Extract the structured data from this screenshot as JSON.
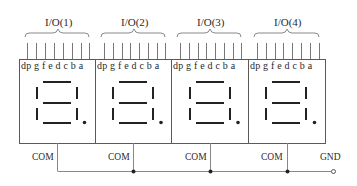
{
  "diagram": {
    "type": "4-digit 7-segment display common-cathode wiring",
    "modules": [
      {
        "io_label": "I/O(1)",
        "com_label": "COM"
      },
      {
        "io_label": "I/O(2)",
        "com_label": "COM"
      },
      {
        "io_label": "I/O(3)",
        "com_label": "COM"
      },
      {
        "io_label": "I/O(4)",
        "com_label": "COM"
      }
    ],
    "pin_labels": "dp g f e d c b a",
    "pins": [
      "dp",
      "g",
      "f",
      "e",
      "d",
      "c",
      "b",
      "a"
    ],
    "ground_label": "GND",
    "colors": {
      "line": "#555555",
      "segment": "#222222",
      "background": "#ffffff"
    }
  }
}
